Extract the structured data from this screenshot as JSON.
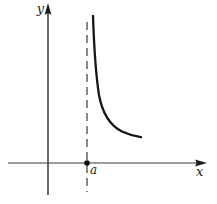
{
  "figure": {
    "background_color": "#ffffff",
    "ink_color": "#1e1e1e",
    "axes": {
      "x_label": "x",
      "y_label": "y"
    },
    "asymptote": {
      "point_label": "a",
      "line_style": "dashed",
      "x_position": "a"
    },
    "curve": {
      "style": "solid",
      "path_d": "M 93 16 C 93.8 40 94.8 68 99 95 C 102.5 114 111 126 122 131.5 C 128 134.3 135 136.2 141 137.2",
      "points": [
        [
          93,
          16
        ],
        [
          94,
          50
        ],
        [
          96,
          80
        ],
        [
          100,
          100
        ],
        [
          106,
          115
        ],
        [
          115,
          126
        ],
        [
          128,
          133
        ],
        [
          141,
          137
        ]
      ]
    }
  }
}
